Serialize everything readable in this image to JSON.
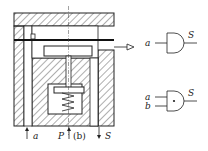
{
  "diagram": {
    "caption": "(b)",
    "ports": {
      "a": "a",
      "p": "P",
      "s": "S"
    },
    "symbols": [
      {
        "name": "single-input",
        "inputs": [
          "a"
        ],
        "output": "S"
      },
      {
        "name": "two-input-and",
        "inputs": [
          "a",
          "b"
        ],
        "output": "S"
      }
    ],
    "colors": {
      "line": "#222222",
      "background": "#ffffff"
    }
  }
}
